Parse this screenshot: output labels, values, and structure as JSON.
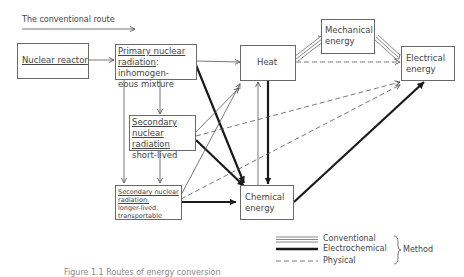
{
  "title": {
    "text": "The conventional route"
  },
  "nodes": {
    "reactor": {
      "label": "Nuclear reactor"
    },
    "primary": {
      "line1": "Primary nuclear",
      "line2": "radiation",
      "line2b": ": inhomogen-",
      "line3": "eous mixture"
    },
    "secondary_short": {
      "line1": "Secondary",
      "line2": "nuclear radiation",
      "line3": "short-lived"
    },
    "secondary_long": {
      "line1": "Secondary nuclear",
      "line2": "radiation,",
      "line3": "longer-lived,",
      "line4": "transportable"
    },
    "heat": {
      "label": "Heat"
    },
    "mechanical": {
      "line1": "Mechanical",
      "line2": "energy"
    },
    "electrical": {
      "line1": "Electrical",
      "line2": "energy"
    },
    "chemical": {
      "line1": "Chemical",
      "line2": "energy"
    }
  },
  "legend": {
    "items": [
      {
        "style": "triple-line",
        "label": "Conventional"
      },
      {
        "style": "thick-line",
        "label": "Electrochemical"
      },
      {
        "style": "dashed-line",
        "label": "Physical"
      }
    ],
    "group_label": "Method"
  },
  "caption": {
    "text": "Figure 1.1 Routes of energy conversion"
  },
  "colors": {
    "line": "#5a5a5a",
    "thick": "#1a1a1a",
    "box_border": "#6a6a6a"
  }
}
